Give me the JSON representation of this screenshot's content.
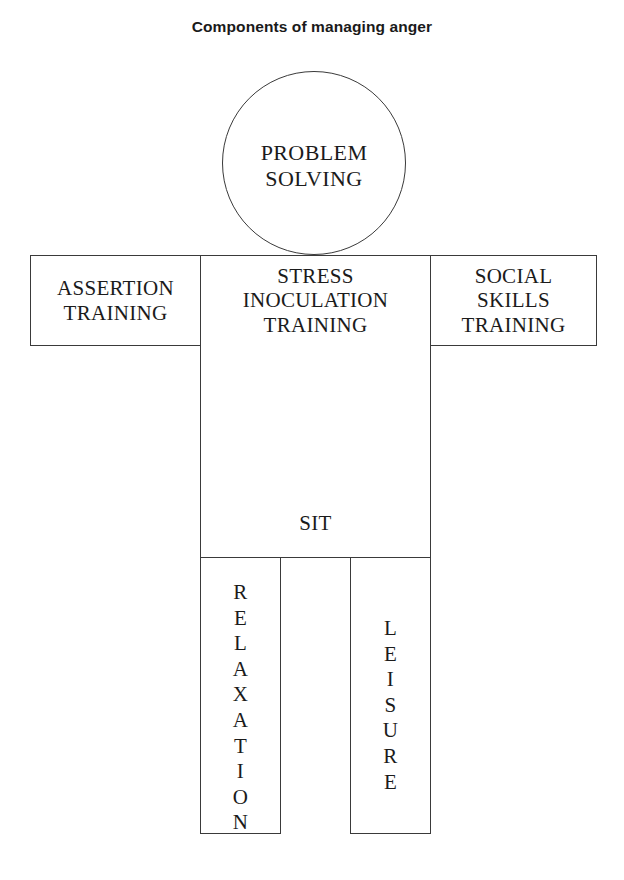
{
  "title": "Components of managing anger",
  "diagram": {
    "type": "body-figure-diagram",
    "parts": {
      "head": {
        "shape": "circle",
        "label": "PROBLEM\nSOLVING"
      },
      "left_arm": {
        "shape": "rectangle",
        "label": "ASSERTION\nTRAINING"
      },
      "right_arm": {
        "shape": "rectangle",
        "label": "SOCIAL\nSKILLS\nTRAINING"
      },
      "torso": {
        "shape": "rectangle",
        "label_top": "STRESS\nINOCULATION\nTRAINING",
        "label_bottom": "SIT"
      },
      "left_leg": {
        "shape": "rectangle",
        "orientation": "vertical-letters",
        "label": "RELAXATION",
        "letters": [
          "R",
          "E",
          "L",
          "A",
          "X",
          "A",
          "T",
          "I",
          "O",
          "N"
        ]
      },
      "right_leg": {
        "shape": "rectangle",
        "orientation": "vertical-letters",
        "label": "LEISURE",
        "letters": [
          "L",
          "E",
          "I",
          "S",
          "U",
          "R",
          "E"
        ]
      }
    }
  },
  "colors": {
    "background": "#ffffff",
    "stroke": "#3a3a3a",
    "text": "#1b1b1b",
    "title_text": "#1a1a1a"
  }
}
